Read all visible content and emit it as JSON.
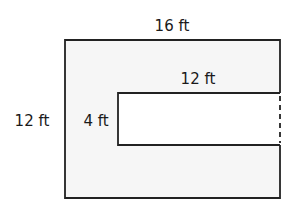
{
  "diagram": {
    "type": "composite-rectangle-area",
    "outer": {
      "width_label": "16 ft",
      "height_label": "12 ft",
      "fill": "#f6f6f6"
    },
    "inner": {
      "width_label": "12 ft",
      "height_label": "4 ft",
      "fill": "#ffffff"
    },
    "stroke_color": "#222222",
    "labels": {
      "top": "16 ft",
      "inner_top": "12 ft",
      "left": "12 ft",
      "inner_left": "4 ft"
    }
  }
}
